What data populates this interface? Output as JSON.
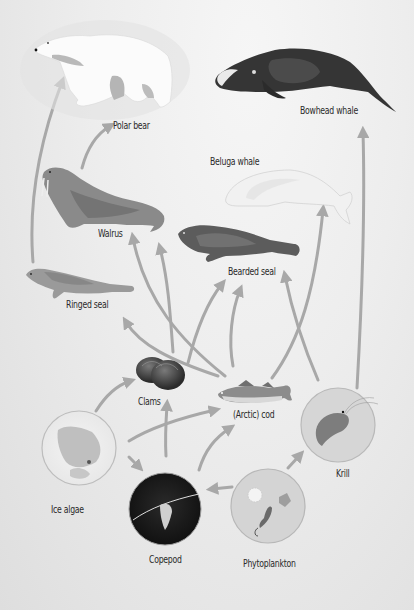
{
  "diagram": {
    "background_color": "#ebebeb",
    "arrow_color": "#a8a8a8",
    "organisms": [
      {
        "id": "polar_bear",
        "label": "Polar bear",
        "icon": "polar-bear-icon"
      },
      {
        "id": "bowhead_whale",
        "label": "Bowhead whale",
        "icon": "bowhead-whale-icon"
      },
      {
        "id": "beluga_whale",
        "label": "Beluga whale",
        "icon": "beluga-whale-icon"
      },
      {
        "id": "walrus",
        "label": "Walrus",
        "icon": "walrus-icon"
      },
      {
        "id": "bearded_seal",
        "label": "Bearded seal",
        "icon": "bearded-seal-icon"
      },
      {
        "id": "ringed_seal",
        "label": "Ringed seal",
        "icon": "ringed-seal-icon"
      },
      {
        "id": "clams",
        "label": "Clams",
        "icon": "clams-icon"
      },
      {
        "id": "arctic_cod",
        "label": "(Arctic) cod",
        "icon": "cod-icon"
      },
      {
        "id": "krill",
        "label": "Krill",
        "icon": "krill-icon"
      },
      {
        "id": "ice_algae",
        "label": "Ice algae",
        "icon": "ice-algae-icon"
      },
      {
        "id": "copepod",
        "label": "Copepod",
        "icon": "copepod-icon"
      },
      {
        "id": "phytoplankton",
        "label": "Phytoplankton",
        "icon": "phytoplankton-icon"
      }
    ],
    "edges": [
      {
        "from": "ringed_seal",
        "to": "polar_bear"
      },
      {
        "from": "walrus",
        "to": "polar_bear"
      },
      {
        "from": "krill",
        "to": "bowhead_whale"
      },
      {
        "from": "arctic_cod",
        "to": "beluga_whale"
      },
      {
        "from": "krill",
        "to": "bearded_seal"
      },
      {
        "from": "arctic_cod",
        "to": "walrus"
      },
      {
        "from": "clams",
        "to": "walrus"
      },
      {
        "from": "arctic_cod",
        "to": "ringed_seal"
      },
      {
        "from": "clams",
        "to": "bearded_seal"
      },
      {
        "from": "arctic_cod",
        "to": "bearded_seal"
      },
      {
        "from": "ice_algae",
        "to": "clams"
      },
      {
        "from": "copepod",
        "to": "clams"
      },
      {
        "from": "ice_algae",
        "to": "arctic_cod"
      },
      {
        "from": "copepod",
        "to": "arctic_cod"
      },
      {
        "from": "ice_algae",
        "to": "copepod"
      },
      {
        "from": "phytoplankton",
        "to": "copepod"
      },
      {
        "from": "phytoplankton",
        "to": "krill"
      }
    ]
  }
}
